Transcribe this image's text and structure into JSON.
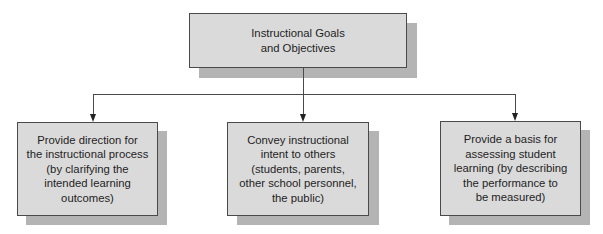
{
  "diagram": {
    "type": "hierarchy",
    "colors": {
      "box_fill": "#dadada",
      "box_border": "#4a4a4a",
      "shadow": "#b4b4b4",
      "connector": "#4a4a4a",
      "text": "#1e1e1e"
    },
    "root": {
      "label": "Instructional Goals\nand Objectives"
    },
    "children": [
      {
        "label": "Provide direction for\nthe instructional process\n(by clarifying the\nintended learning\noutcomes)"
      },
      {
        "label": "Convey instructional\nintent to others\n(students, parents,\nother school personnel,\nthe public)"
      },
      {
        "label": "Provide a basis for\nassessing student\nlearning (by describing\nthe performance to\nbe measured)"
      }
    ],
    "edges": [
      {
        "from": "root",
        "to": "children.0"
      },
      {
        "from": "root",
        "to": "children.1"
      },
      {
        "from": "root",
        "to": "children.2"
      }
    ]
  }
}
